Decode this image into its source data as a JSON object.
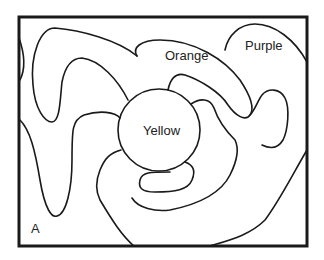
{
  "diagram": {
    "type": "map-coloring",
    "labels": {
      "center": "Yellow",
      "top": "Orange",
      "top_right": "Purple",
      "corner": "A"
    },
    "colors": {
      "line": "#1a1a1a",
      "text": "#222222",
      "background": "#ffffff"
    }
  }
}
